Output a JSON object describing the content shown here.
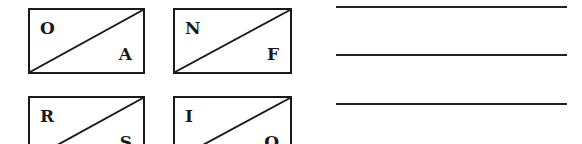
{
  "boxes": [
    {
      "top_left": "O",
      "bottom_right": "A"
    },
    {
      "top_left": "N",
      "bottom_right": "F"
    },
    {
      "top_left": "R",
      "bottom_right": "S"
    },
    {
      "top_left": "I",
      "bottom_right": "O"
    }
  ],
  "answer_lines": 3
}
